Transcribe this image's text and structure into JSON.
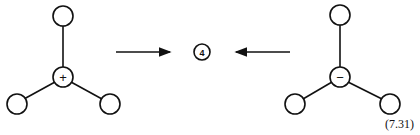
{
  "diagram": {
    "left_molecule": {
      "center_sign": "+",
      "ligands": 3
    },
    "right_molecule": {
      "center_sign": "−",
      "ligands": 3
    },
    "product_label": "4",
    "arrows": [
      {
        "direction": "right",
        "from": "left_molecule",
        "to": "product"
      },
      {
        "direction": "left",
        "from": "right_molecule",
        "to": "product"
      }
    ],
    "equation_number": "(7.31)"
  }
}
